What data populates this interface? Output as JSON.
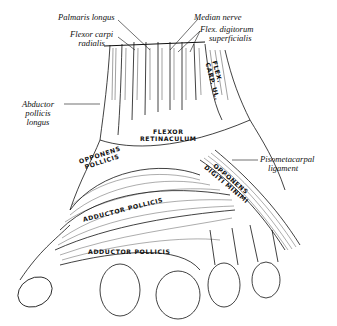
{
  "figure": {
    "colors": {
      "ink": "#111111",
      "background": "#ffffff"
    }
  },
  "labels": {
    "palmaris_longus": "Palmaris longus",
    "flexor_carpi_radialis_1": "Flexor carpi",
    "flexor_carpi_radialis_2": "radialis",
    "median_nerve": "Median nerve",
    "flex_digitorum_1": "Flex. digitorum",
    "flex_digitorum_2": "superficialis",
    "abductor_pollicis_longus_1": "Abductor",
    "abductor_pollicis_longus_2": "pollicis",
    "abductor_pollicis_longus_3": "longus",
    "pisometacarpal_1": "Pisometacarpal",
    "pisometacarpal_2": "ligament"
  },
  "inline_labels": {
    "flex_carp_ul_1": "FLEX.",
    "flex_carp_ul_2": "CARP. UL.",
    "flexor_retinaculum_1": "FLEXOR",
    "flexor_retinaculum_2": "RETINACULUM",
    "opponens_pollicis_1": "OPPONENS",
    "opponens_pollicis_2": "POLLICIS",
    "opponens_digiti_1": "OPPONENS",
    "opponens_digiti_2": "DIGITI MINIMI",
    "adductor_pollicis_upper": "ADDUCTOR POLLICIS",
    "adductor_pollicis_lower": "ADDUCTOR POLLICIS"
  }
}
